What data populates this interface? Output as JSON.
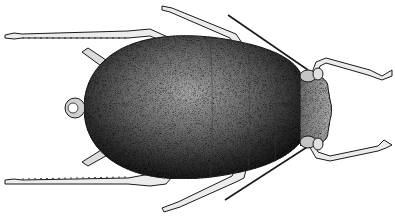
{
  "image": {
    "subject": "aphid",
    "style": "stippled black-and-white scientific illustration",
    "view": "dorsal",
    "orientation": "head right, abdomen left",
    "width": 395,
    "height": 218,
    "colors": {
      "background": "#ffffff",
      "ink": "#1a1a1a",
      "body_dark": "#2a2a2a",
      "body_mid": "#6e6e6e",
      "body_light": "#c8c8c8",
      "leg_fill": "#e8e8e8"
    },
    "parts": [
      "body",
      "head",
      "antennae",
      "cornicles",
      "cauda",
      "legs"
    ]
  }
}
